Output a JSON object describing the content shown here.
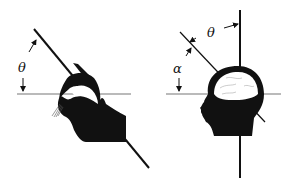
{
  "figure": {
    "left_panel": {
      "subject": "cat",
      "angle_label": "θ",
      "lines": [
        "horizontal-reference",
        "tilted-axis"
      ]
    },
    "right_panel": {
      "subject": "human-head",
      "angle_labels": [
        "θ",
        "α"
      ],
      "lines": [
        "horizontal-reference",
        "vertical-axis",
        "tilted-axis"
      ]
    },
    "colors": {
      "ink": "#111111",
      "reference_line": "#777777",
      "background": "#ffffff"
    }
  }
}
